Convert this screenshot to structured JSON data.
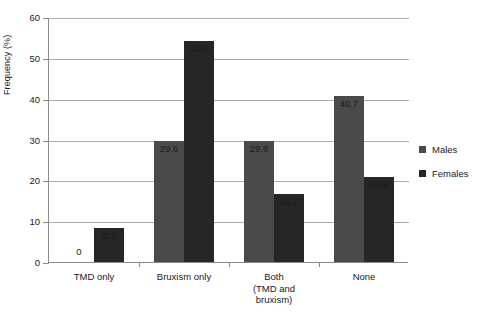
{
  "chart_data": {
    "type": "bar",
    "title": "",
    "xlabel": "",
    "ylabel": "Frequency (%)",
    "ylim": [
      0,
      60
    ],
    "yticks": [
      0,
      10,
      20,
      30,
      40,
      50,
      60
    ],
    "ytick_labels": [
      "0",
      "10",
      "20",
      "30",
      "40",
      "50",
      "60"
    ],
    "grid": true,
    "legend_position": "right",
    "categories": [
      "TMD only",
      "Bruxism only",
      "Both\n(TMD and\nbruxism)",
      "None"
    ],
    "category_lines": [
      [
        "TMD only"
      ],
      [
        "Bruxism only"
      ],
      [
        "Both",
        "(TMD and",
        "bruxism)"
      ],
      [
        "None"
      ]
    ],
    "series": [
      {
        "name": "Males",
        "color": "#4a4a4a",
        "values": [
          0,
          29.6,
          29.6,
          40.7
        ],
        "labels": [
          "0",
          "29.6",
          "29.6",
          "40.7"
        ]
      },
      {
        "name": "Females",
        "color": "#262626",
        "values": [
          8.3,
          54.2,
          16.7,
          20.8
        ],
        "labels": [
          "8.3",
          "54.2",
          "16.7",
          "20.8"
        ]
      }
    ]
  },
  "legend": {
    "items": [
      {
        "label": "Males",
        "color": "#4a4a4a"
      },
      {
        "label": "Females",
        "color": "#262626"
      }
    ]
  },
  "axes": {
    "y_title": "Frequency (%)"
  }
}
